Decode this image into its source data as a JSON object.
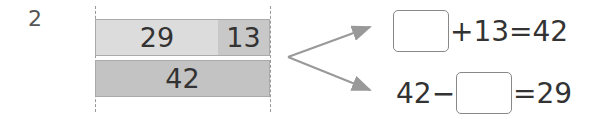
{
  "problem": {
    "number": "2"
  },
  "tape_diagram": {
    "top_bar": [
      {
        "label": "29",
        "color": "#dcdcdc"
      },
      {
        "label": "13",
        "color": "#c8c8c8"
      }
    ],
    "bottom_bar": {
      "label": "42",
      "color": "#c3c3c3"
    }
  },
  "equations": [
    {
      "prefix": "",
      "blank": true,
      "suffix": "+13=42"
    },
    {
      "prefix": "42−",
      "blank": true,
      "suffix": "=29"
    }
  ],
  "colors": {
    "arrow": "#999999",
    "box_border": "#888888",
    "text": "#333333"
  }
}
